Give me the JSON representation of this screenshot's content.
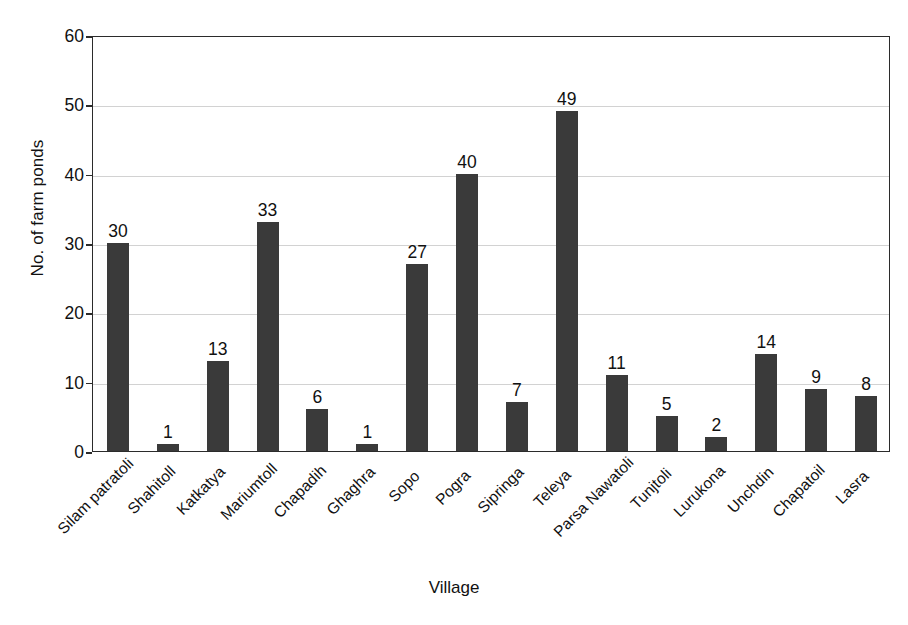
{
  "chart_data": {
    "type": "bar",
    "title": "",
    "xlabel": "Village",
    "ylabel": "No. of farm ponds",
    "ylim": [
      0,
      60
    ],
    "ytick_step": 10,
    "yticks": [
      0,
      10,
      20,
      30,
      40,
      50,
      60
    ],
    "grid": true,
    "legend": false,
    "bar_color": "#3a3a3a",
    "axis_color": "#2b2b2b",
    "gridline_color": "#d2d2d2",
    "background_color": "#ffffff",
    "value_labels_shown": true,
    "category_label_rotation_deg": -45,
    "categories": [
      "Silam patratoli",
      "Shahitoll",
      "Katkatya",
      "Mariumtoll",
      "Chapadih",
      "Ghaghra",
      "Sopo",
      "Pogra",
      "Sipringa",
      "Teleya",
      "Parsa Nawatoli",
      "Tunjtoli",
      "Lurukona",
      "Unchdin",
      "Chapatoil",
      "Lasra"
    ],
    "values": [
      30,
      1,
      13,
      33,
      6,
      1,
      27,
      40,
      7,
      49,
      11,
      5,
      2,
      14,
      9,
      8
    ]
  }
}
